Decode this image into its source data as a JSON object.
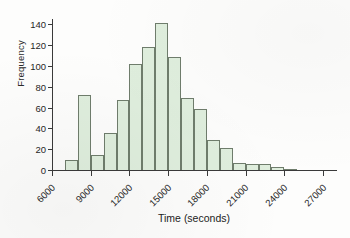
{
  "chart_data": {
    "type": "bar",
    "title": "",
    "subtitle": "",
    "xlabel": "Time (seconds)",
    "ylabel": "Frequency",
    "xlim": [
      6000,
      28000
    ],
    "ylim": [
      0,
      145
    ],
    "grid": false,
    "legend": null,
    "bin_width": 1000,
    "bar_fill_color": "#dfeedd",
    "bar_edge_color": "#6f7d6c",
    "axis_color": "#3a3a3a",
    "x_ticks": [
      6000,
      9000,
      12000,
      15000,
      18000,
      21000,
      24000,
      27000
    ],
    "x_tick_labels": [
      "6000",
      "9000",
      "12000",
      "15000",
      "18000",
      "21000",
      "24000",
      "27000"
    ],
    "y_ticks": [
      0,
      20,
      40,
      60,
      80,
      100,
      120,
      140
    ],
    "y_tick_labels": [
      "0",
      "20",
      "40",
      "60",
      "80",
      "100",
      "120",
      "140"
    ],
    "bin_starts": [
      7000,
      8000,
      9000,
      10000,
      11000,
      12000,
      13000,
      14000,
      15000,
      16000,
      17000,
      18000,
      19000,
      20000,
      21000,
      22000,
      23000,
      24000,
      25000,
      26000,
      27000
    ],
    "categories": [
      "7000-8000",
      "8000-9000",
      "9000-10000",
      "10000-11000",
      "11000-12000",
      "12000-13000",
      "13000-14000",
      "14000-15000",
      "15000-16000",
      "16000-17000",
      "17000-18000",
      "18000-19000",
      "19000-20000",
      "20000-21000",
      "21000-22000",
      "22000-23000",
      "23000-24000",
      "24000-25000",
      "25000-26000",
      "26000-27000",
      "27000-28000"
    ],
    "values": [
      10,
      72,
      14,
      36,
      67,
      102,
      118,
      141,
      109,
      69,
      59,
      29,
      21,
      7,
      6,
      6,
      3,
      1,
      0,
      0,
      0
    ]
  }
}
